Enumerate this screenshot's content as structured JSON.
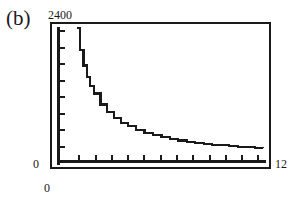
{
  "figure": {
    "panel_label": "(b)"
  },
  "chart_data": {
    "type": "line",
    "title": "",
    "subtitle": "",
    "xlabel": "",
    "ylabel": "",
    "xlim": [
      0,
      12
    ],
    "ylim": [
      0,
      2400
    ],
    "x_tick_labels": [
      "0",
      "12"
    ],
    "y_tick_labels": [
      "0",
      "2400"
    ],
    "grid": false,
    "legend": null,
    "annotations": [],
    "axis_labels": {
      "y_max": "2400",
      "y_min": "0",
      "x_min": "0",
      "x_max": "12"
    },
    "y_tick_count": 8,
    "x_tick_count": 12,
    "series": [
      {
        "name": "decay-curve",
        "color": "#1a1a1a",
        "x": [
          1.0,
          1.2,
          1.4,
          1.6,
          1.8,
          2.0,
          2.4,
          2.8,
          3.2,
          3.6,
          4.0,
          4.5,
          5.0,
          5.5,
          6.0,
          6.5,
          7.0,
          7.5,
          8.0,
          8.5,
          9.0,
          9.5,
          10.0,
          10.5,
          11.0,
          11.5,
          12.0
        ],
        "values": [
          2400,
          2000,
          1714,
          1500,
          1333,
          1200,
          1000,
          857,
          750,
          667,
          600,
          533,
          480,
          436,
          400,
          369,
          343,
          320,
          300,
          282,
          267,
          253,
          240,
          229,
          218,
          209,
          200
        ]
      }
    ]
  }
}
